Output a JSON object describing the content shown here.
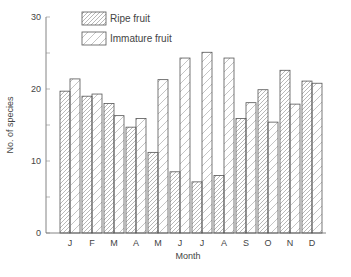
{
  "chart_data": {
    "type": "bar",
    "title": "",
    "xlabel": "Month",
    "ylabel": "No. of species",
    "ylim": [
      0,
      30
    ],
    "yticks": [
      0,
      10,
      20,
      30
    ],
    "categories": [
      "J",
      "F",
      "M",
      "A",
      "M",
      "J",
      "J",
      "A",
      "S",
      "O",
      "N",
      "D"
    ],
    "series": [
      {
        "name": "Ripe fruit",
        "pattern": "dense-hatch",
        "values": [
          19.7,
          19.0,
          18.0,
          14.7,
          11.2,
          8.5,
          7.1,
          8.0,
          15.9,
          19.9,
          22.6,
          21.1
        ]
      },
      {
        "name": "Immature fruit",
        "pattern": "sparse-hatch",
        "values": [
          21.4,
          19.3,
          16.3,
          15.9,
          21.3,
          24.3,
          25.1,
          24.3,
          18.1,
          15.4,
          17.9,
          20.8
        ]
      }
    ],
    "legend_position": "top-left-inside",
    "grid": false
  },
  "legend": {
    "ripe_label": "Ripe fruit",
    "immature_label": "Immature fruit"
  },
  "axes": {
    "xlabel": "Month",
    "ylabel": "No. of species"
  },
  "colors": {
    "stroke": "#555555",
    "hatch": "#888888",
    "background": "#ffffff"
  }
}
